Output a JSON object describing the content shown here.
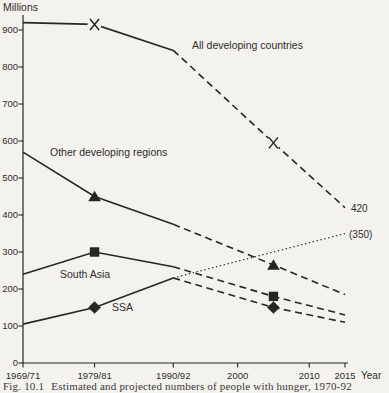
{
  "figure": {
    "caption_label": "Fig. 10.1",
    "caption_text": "Estimated and projected numbers of people with hunger, 1970-92"
  },
  "colors": {
    "ink": "#262624",
    "paper": "#f4f2ee"
  },
  "chart_data": {
    "type": "line",
    "title": "",
    "ylabel": "Millions",
    "xlabel": "Year",
    "ylim": [
      0,
      950
    ],
    "xlim_years": [
      1970,
      2015
    ],
    "grid": false,
    "y_ticks": [
      0,
      100,
      200,
      300,
      400,
      500,
      600,
      700,
      800,
      900
    ],
    "x_ticks": [
      {
        "year": 1970,
        "label": "1969/71"
      },
      {
        "year": 1980,
        "label": "1979/81"
      },
      {
        "year": 1991,
        "label": "1990/92"
      },
      {
        "year": 2000,
        "label": "2000"
      },
      {
        "year": 2010,
        "label": "2010"
      },
      {
        "year": 2015,
        "label": "2015"
      }
    ],
    "series": [
      {
        "name": "All developing countries",
        "marker": "x",
        "points": {
          "solid": [
            [
              1970,
              920
            ],
            [
              1980,
              915
            ],
            [
              1991,
              845
            ]
          ],
          "dashed": [
            [
              1991,
              845
            ],
            [
              2005,
              595
            ],
            [
              2015,
              420
            ]
          ]
        },
        "marker_points": [
          [
            1980,
            915
          ],
          [
            2005,
            595
          ]
        ],
        "end_label": "420",
        "label_pos": [
          192,
          49
        ],
        "label_anchor": "start"
      },
      {
        "name": "Other developing regions",
        "marker": "triangle",
        "points": {
          "solid": [
            [
              1970,
              570
            ],
            [
              1980,
              450
            ],
            [
              1991,
              375
            ]
          ],
          "dashed": [
            [
              1991,
              375
            ],
            [
              2005,
              265
            ],
            [
              2015,
              185
            ]
          ]
        },
        "marker_points": [
          [
            1980,
            450
          ],
          [
            2005,
            265
          ]
        ],
        "label_pos": [
          50,
          156
        ],
        "label_anchor": "start"
      },
      {
        "name": "South Asia",
        "marker": "square",
        "points": {
          "solid": [
            [
              1970,
              240
            ],
            [
              1980,
              300
            ],
            [
              1991,
              260
            ]
          ],
          "dashed": [
            [
              1991,
              260
            ],
            [
              2005,
              180
            ],
            [
              2015,
              130
            ]
          ]
        },
        "marker_points": [
          [
            1980,
            300
          ],
          [
            2005,
            180
          ]
        ],
        "label_pos": [
          60,
          278
        ],
        "label_anchor": "start"
      },
      {
        "name": "SSA",
        "marker": "diamond",
        "points": {
          "solid": [
            [
              1970,
              105
            ],
            [
              1980,
              150
            ],
            [
              1991,
              230
            ]
          ],
          "dashed": [
            [
              1991,
              230
            ],
            [
              2005,
              150
            ],
            [
              2015,
              110
            ]
          ],
          "dotted": [
            [
              1991,
              230
            ],
            [
              2015,
              350
            ]
          ]
        },
        "marker_points": [
          [
            1980,
            150
          ],
          [
            2005,
            150
          ]
        ],
        "dotted_end_label": "(350)",
        "label_pos": [
          112,
          311
        ],
        "label_anchor": "start"
      }
    ]
  }
}
